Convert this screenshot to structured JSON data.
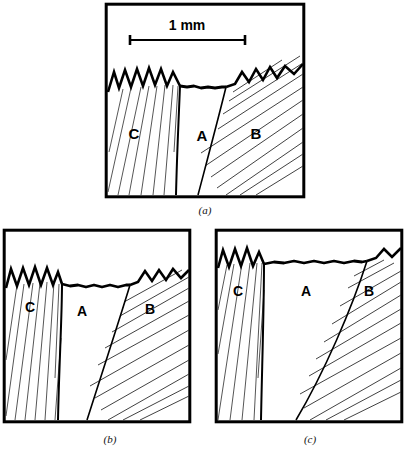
{
  "figure": {
    "type": "micrograph-tracing",
    "background_color": "#ffffff",
    "line_color": "#000000",
    "hatch_color": "#111111"
  },
  "scale_bar": {
    "label": "1 mm",
    "length_px": 115,
    "present_in_panel": "a"
  },
  "panels": [
    {
      "id": "a",
      "caption": "(a)",
      "frame": {
        "x": 0,
        "y": 0,
        "width": 202,
        "height": 196
      },
      "has_scale_bar": true,
      "regions": [
        {
          "label": "C",
          "label_x": 30,
          "label_y": 131,
          "surface": "serrated"
        },
        {
          "label": "A",
          "label_x": 98,
          "label_y": 133,
          "surface": "smooth"
        },
        {
          "label": "B",
          "label_x": 152,
          "label_y": 131,
          "surface": "serrated"
        }
      ]
    },
    {
      "id": "b",
      "caption": "(b)",
      "frame": {
        "x": 0,
        "y": 0,
        "width": 190,
        "height": 196
      },
      "has_scale_bar": false,
      "regions": [
        {
          "label": "C",
          "label_x": 28,
          "label_y": 78,
          "surface": "serrated"
        },
        {
          "label": "A",
          "label_x": 80,
          "label_y": 82,
          "surface": "smooth"
        },
        {
          "label": "B",
          "label_x": 148,
          "label_y": 80,
          "surface": "serrated"
        }
      ]
    },
    {
      "id": "c",
      "caption": "(c)",
      "frame": {
        "x": 0,
        "y": 0,
        "width": 190,
        "height": 196
      },
      "has_scale_bar": false,
      "regions": [
        {
          "label": "C",
          "label_x": 24,
          "label_y": 62,
          "surface": "serrated"
        },
        {
          "label": "A",
          "label_x": 92,
          "label_y": 62,
          "surface": "smooth"
        },
        {
          "label": "B",
          "label_x": 155,
          "label_y": 62,
          "surface": "serrated"
        }
      ]
    }
  ]
}
